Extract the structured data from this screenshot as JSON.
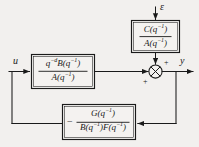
{
  "diagram": {
    "type": "control-system-block-diagram",
    "background_color": "#f2f0ee",
    "line_color": "#1a1a1a",
    "signals": {
      "input": "u",
      "output": "y",
      "disturbance": "ε"
    },
    "blocks": [
      {
        "id": "plant",
        "name": "forward-path-block",
        "numerator": "q",
        "numerator_exponent": "−d",
        "numerator_rest": "B(q",
        "numerator_rest_exp": "−1",
        "numerator_close": ")",
        "denominator": "A(q",
        "denominator_exp": "−1",
        "denominator_close": ")",
        "numerator_text": "q−dB(q−1)",
        "denominator_text": "A(q−1)"
      },
      {
        "id": "noise",
        "name": "disturbance-filter-block",
        "numerator_text": "C(q−1)",
        "denominator_text": "A(q−1)"
      },
      {
        "id": "feedback",
        "name": "feedback-block",
        "numerator_text": "G(q−1)",
        "denominator_text": "B(q−1)F(q−1)",
        "leading_sign": "−"
      }
    ],
    "summing_junction": {
      "name": "summing-junction",
      "symbol": "⊗",
      "sign_top": "+",
      "sign_bottom": "+"
    }
  }
}
